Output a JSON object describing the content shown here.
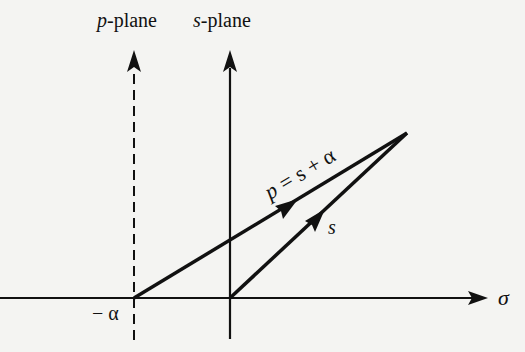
{
  "diagram": {
    "labels": {
      "p_plane_var": "p",
      "p_plane_suffix": "-plane",
      "s_plane_var": "s",
      "s_plane_suffix": "-plane",
      "sigma": "σ",
      "minus_alpha": "− α",
      "vector_p_p": "p",
      "vector_p_eq": "= s + α",
      "vector_s": "s"
    },
    "colors": {
      "background": "#f4f4f2",
      "ink": "#111111"
    }
  }
}
